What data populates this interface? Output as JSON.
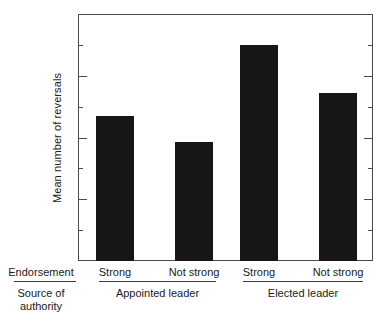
{
  "chart_data": {
    "type": "bar",
    "title": "",
    "xlabel": "",
    "ylabel": "Mean number of reversals",
    "ylim": [
      0,
      4
    ],
    "ytick_labels": [
      "1",
      "2",
      "3",
      "4"
    ],
    "ytick_values": [
      1,
      2,
      3,
      4
    ],
    "yminor_values": [
      0.5,
      1.5,
      2.5,
      3.5
    ],
    "grid": false,
    "legend": "none",
    "categories": [
      "Strong",
      "Not strong",
      "Strong",
      "Not strong"
    ],
    "values": [
      2.35,
      1.92,
      3.5,
      2.72
    ],
    "groups": [
      {
        "label": "Appointed leader",
        "categories": [
          "Strong",
          "Not strong"
        ],
        "values": [
          2.35,
          1.92
        ]
      },
      {
        "label": "Elected leader",
        "categories": [
          "Strong",
          "Not strong"
        ],
        "values": [
          3.5,
          2.72
        ]
      }
    ],
    "bar_color": "#161616",
    "axis_color": "#4a4a4a",
    "row_headers": {
      "endorsement": "Endorsement",
      "source_line1": "Source of",
      "source_line2": "authority"
    }
  },
  "axis": {
    "ticks": [
      {
        "label": "4",
        "value": 4,
        "kind": "major"
      },
      {
        "label": "",
        "value": 3.5,
        "kind": "minor"
      },
      {
        "label": "3",
        "value": 3,
        "kind": "major"
      },
      {
        "label": "",
        "value": 2.5,
        "kind": "minor"
      },
      {
        "label": "2",
        "value": 2,
        "kind": "major"
      },
      {
        "label": "",
        "value": 1.5,
        "kind": "minor"
      },
      {
        "label": "1",
        "value": 1,
        "kind": "major"
      },
      {
        "label": "",
        "value": 0.5,
        "kind": "minor"
      }
    ]
  }
}
